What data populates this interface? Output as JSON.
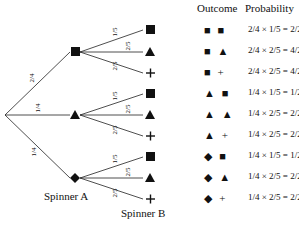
{
  "headers": {
    "outcome": "Outcome",
    "probability": "Probability"
  },
  "labels": {
    "spinner_a": "Spinner A",
    "spinner_b": "Spinner B"
  },
  "spinner_a": {
    "branches": [
      {
        "symbol": "■",
        "name": "square",
        "prob": "2/4"
      },
      {
        "symbol": "▲",
        "name": "triangle",
        "prob": "1/4"
      },
      {
        "symbol": "◆",
        "name": "diamond",
        "prob": "1/4"
      }
    ]
  },
  "spinner_b": {
    "branches": [
      {
        "symbol": "■",
        "name": "square",
        "prob": "1/5"
      },
      {
        "symbol": "▲",
        "name": "triangle",
        "prob": "2/5"
      },
      {
        "symbol": "+",
        "name": "plus",
        "prob": "2/5"
      }
    ]
  },
  "rows": [
    {
      "outcome": "■ ■",
      "probability": "2/4 × 1/5 = 2/20"
    },
    {
      "outcome": "■ ▲",
      "probability": "2/4 × 2/5 = 4/20"
    },
    {
      "outcome": "■ +",
      "probability": "2/4 × 2/5 = 4/20"
    },
    {
      "outcome": "▲ ■",
      "probability": "1/4 × 1/5 = 1/20"
    },
    {
      "outcome": "▲ ▲",
      "probability": "1/4 × 2/5 = 2/20"
    },
    {
      "outcome": "▲ +",
      "probability": "1/4 × 2/5 = 2/20"
    },
    {
      "outcome": "◆ ■",
      "probability": "1/4 × 1/5 = 1/20"
    },
    {
      "outcome": "◆ ▲",
      "probability": "1/4 × 2/5 = 2/20"
    },
    {
      "outcome": "◆ +",
      "probability": "1/4 × 2/5 = 2/20"
    }
  ]
}
